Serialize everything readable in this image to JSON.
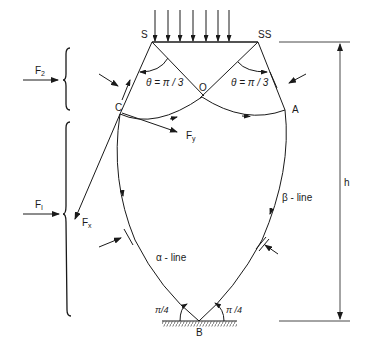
{
  "diagram": {
    "type": "slip-line field diagram",
    "points": {
      "S": "S",
      "SS": "SS",
      "O": "O",
      "C": "C",
      "A": "A",
      "B": "B"
    },
    "angles": {
      "theta_left": "θ = π / 3",
      "theta_right": "θ = π / 3",
      "bottom_left": "π/4",
      "bottom_right": "π /4"
    },
    "forces": {
      "F2": {
        "base": "F",
        "sub": "2"
      },
      "F1": {
        "base": "F",
        "sub": "I"
      },
      "Fx": {
        "base": "F",
        "sub": "x"
      },
      "Fy": {
        "base": "F",
        "sub": "y"
      }
    },
    "lines": {
      "alpha": "α - line",
      "beta": "β - line"
    },
    "dimension": {
      "h": "h"
    },
    "load_arrow_count": 7,
    "colors": {
      "ink": "#1a1a1a",
      "background": "#ffffff"
    }
  }
}
